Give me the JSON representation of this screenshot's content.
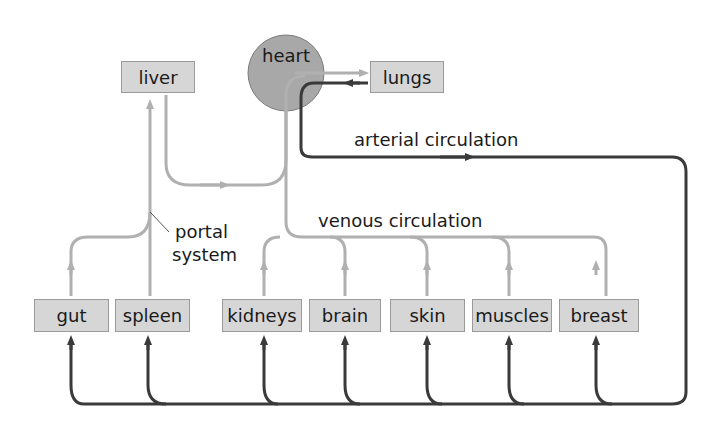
{
  "diagram": {
    "nodes": {
      "heart": {
        "label": "heart",
        "shape": "circle",
        "fill": "#a8a8a8"
      },
      "liver": {
        "label": "liver"
      },
      "lungs": {
        "label": "lungs"
      },
      "gut": {
        "label": "gut"
      },
      "spleen": {
        "label": "spleen"
      },
      "kidneys": {
        "label": "kidneys"
      },
      "brain": {
        "label": "brain"
      },
      "skin": {
        "label": "skin"
      },
      "muscles": {
        "label": "muscles"
      },
      "breast": {
        "label": "breast"
      }
    },
    "annotations": {
      "arterial": "arterial circulation",
      "venous": "venous circulation",
      "portal_line1": "portal",
      "portal_line2": "system"
    },
    "edges": [
      {
        "from": "heart",
        "to": "lungs",
        "type": "venous"
      },
      {
        "from": "lungs",
        "to": "heart",
        "type": "arterial"
      },
      {
        "from": "heart",
        "to": "gut",
        "type": "arterial"
      },
      {
        "from": "heart",
        "to": "spleen",
        "type": "arterial"
      },
      {
        "from": "heart",
        "to": "kidneys",
        "type": "arterial"
      },
      {
        "from": "heart",
        "to": "brain",
        "type": "arterial"
      },
      {
        "from": "heart",
        "to": "skin",
        "type": "arterial"
      },
      {
        "from": "heart",
        "to": "muscles",
        "type": "arterial"
      },
      {
        "from": "heart",
        "to": "breast",
        "type": "arterial"
      },
      {
        "from": "gut",
        "to": "liver",
        "type": "portal"
      },
      {
        "from": "spleen",
        "to": "liver",
        "type": "portal"
      },
      {
        "from": "liver",
        "to": "heart",
        "type": "venous"
      },
      {
        "from": "kidneys",
        "to": "heart",
        "type": "venous"
      },
      {
        "from": "brain",
        "to": "heart",
        "type": "venous"
      },
      {
        "from": "skin",
        "to": "heart",
        "type": "venous"
      },
      {
        "from": "muscles",
        "to": "heart",
        "type": "venous"
      },
      {
        "from": "breast",
        "to": "heart",
        "type": "venous"
      }
    ],
    "colors": {
      "arterial": "#3a3a3a",
      "venous": "#b0b0b0",
      "box_fill": "#d6d6d6",
      "heart_fill": "#a8a8a8"
    }
  }
}
